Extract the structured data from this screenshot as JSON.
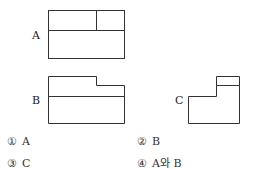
{
  "figures": {
    "A": {
      "label": "A"
    },
    "B": {
      "label": "B"
    },
    "C": {
      "label": "C"
    }
  },
  "options": [
    {
      "number": "①",
      "text": "A"
    },
    {
      "number": "②",
      "text": "B"
    },
    {
      "number": "③",
      "text": "C"
    },
    {
      "number": "④",
      "text": "A와 B"
    }
  ],
  "colors": {
    "line": "#333333",
    "text": "#222222",
    "background": "#ffffff"
  }
}
